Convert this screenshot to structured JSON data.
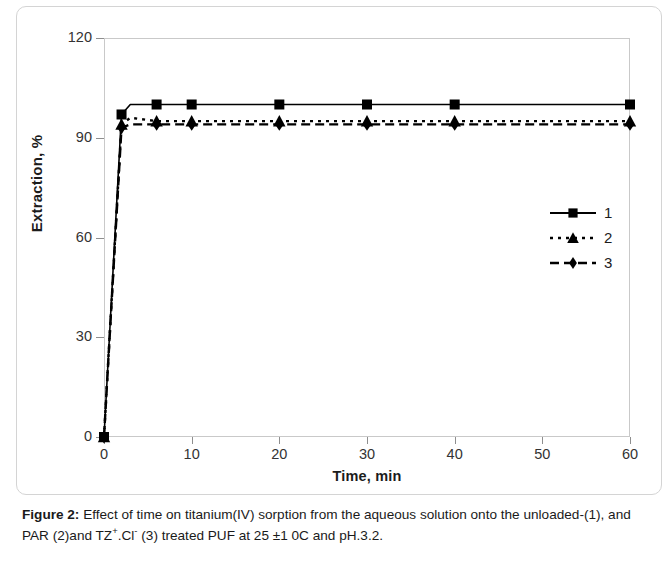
{
  "figure": {
    "caption_prefix": "Figure 2:",
    "caption_text": " Effect of time on titanium(IV) sorption from the aqueous solution onto the unloaded-(1), and PAR (2)and TZ",
    "caption_sup1": "+",
    "caption_mid": ".Cl",
    "caption_sup2": "-",
    "caption_tail": " (3) treated PUF at 25 ±1 0C and pH.3.2."
  },
  "chart_data": {
    "type": "line",
    "title": "",
    "xlabel": "Time, min",
    "ylabel": "Extraction, %",
    "xlim": [
      0,
      60
    ],
    "ylim": [
      0,
      120
    ],
    "xticks": [
      0,
      10,
      20,
      30,
      40,
      50,
      60
    ],
    "yticks": [
      0,
      30,
      60,
      90,
      120
    ],
    "grid": false,
    "legend_position": "right-middle",
    "series": [
      {
        "name": "1",
        "label": "1",
        "linestyle": "solid",
        "marker": "square",
        "color": "#000000",
        "x": [
          0,
          2,
          3,
          6,
          10,
          20,
          30,
          40,
          60
        ],
        "y": [
          0,
          97,
          100,
          100,
          100,
          100,
          100,
          100,
          100
        ]
      },
      {
        "name": "2",
        "label": "2",
        "linestyle": "dotted",
        "marker": "triangle",
        "color": "#000000",
        "x": [
          0,
          2,
          3,
          6,
          10,
          20,
          30,
          40,
          60
        ],
        "y": [
          0,
          94,
          96,
          95,
          95,
          95,
          95,
          95,
          95
        ]
      },
      {
        "name": "3",
        "label": "3",
        "linestyle": "dashed",
        "marker": "diamond",
        "color": "#000000",
        "x": [
          0,
          2,
          3,
          6,
          10,
          20,
          30,
          40,
          60
        ],
        "y": [
          0,
          93,
          94,
          94,
          94,
          94,
          94,
          94,
          94
        ]
      }
    ]
  }
}
